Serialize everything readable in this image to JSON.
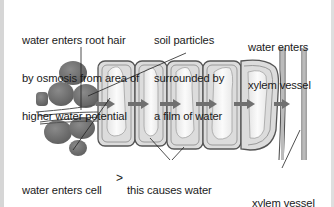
{
  "diagram": {
    "labels": {
      "root_hair_entry": [
        "water enters root hair",
        "by osmosis from area of",
        "higher water potential"
      ],
      "soil_particles": [
        "soil particles",
        "surrounded by",
        "a film of water"
      ],
      "xylem_entry": [
        "water enters",
        "xylem vessel"
      ],
      "cell_entry": [
        "water enters cell",
        "and increases",
        "its water potential"
      ],
      "cell_to_cell": [
        "this causes water",
        "to move from cell",
        "to cell by osmosis"
      ],
      "xylem_vessel": [
        "xylem vessel"
      ]
    },
    "connector_symbol": ">",
    "components": [
      "soil-particles",
      "root-hair",
      "root-cells",
      "water-flow-arrows",
      "xylem-vessel"
    ],
    "colors": {
      "soil_particle": "#6e6e6e",
      "cell_wall": "#5a5a5a",
      "cell_fill": "#dcdcdc",
      "vacuole": "#f4f4f4",
      "arrow": "#707070",
      "frame": "#d6d6d6"
    }
  }
}
